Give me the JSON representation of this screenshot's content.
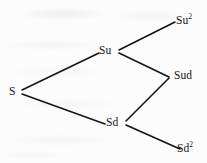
{
  "figure": {
    "type": "binomial-tree",
    "background_color": "#fcfcfc",
    "stroke_color": "#14141a",
    "text_color": "#14141a"
  },
  "nodes": [
    {
      "id": "s",
      "base": "S",
      "exponent": "",
      "step": 0,
      "x": 13,
      "y": 92,
      "anchor_x": 22,
      "anchor_y": 92
    },
    {
      "id": "su",
      "base": "Su",
      "exponent": "",
      "step": 1,
      "x": 105,
      "y": 51,
      "anchor_x": 117,
      "anchor_y": 52
    },
    {
      "id": "sd",
      "base": "Sd",
      "exponent": "",
      "step": 1,
      "x": 112,
      "y": 123,
      "anchor_x": 126,
      "anchor_y": 123
    },
    {
      "id": "su2",
      "base": "Su",
      "exponent": "2",
      "step": 2,
      "x": 182,
      "y": 21,
      "anchor_x": 175,
      "anchor_y": 22
    },
    {
      "id": "sud",
      "base": "Sud",
      "exponent": "",
      "step": 2,
      "x": 181,
      "y": 76,
      "anchor_x": 169,
      "anchor_y": 77
    },
    {
      "id": "sd2",
      "base": "Sd",
      "exponent": "2",
      "step": 2,
      "x": 183,
      "y": 149,
      "anchor_x": 180,
      "anchor_y": 148
    }
  ],
  "edges": [
    {
      "id": "s-su",
      "from": "s",
      "to": "su",
      "direction": "up",
      "x1": 22,
      "y1": 90,
      "x2": 99,
      "y2": 53
    },
    {
      "id": "s-sd",
      "from": "s",
      "to": "sd",
      "direction": "down",
      "x1": 22,
      "y1": 94,
      "x2": 105,
      "y2": 124
    },
    {
      "id": "su-su2",
      "from": "su",
      "to": "su2",
      "direction": "up",
      "x1": 119,
      "y1": 50,
      "x2": 175,
      "y2": 22
    },
    {
      "id": "su-sud",
      "from": "su",
      "to": "sud",
      "direction": "down",
      "x1": 119,
      "y1": 53,
      "x2": 169,
      "y2": 77
    },
    {
      "id": "sd-sud",
      "from": "sd",
      "to": "sud",
      "direction": "up",
      "x1": 126,
      "y1": 121,
      "x2": 169,
      "y2": 78
    },
    {
      "id": "sd-sd2",
      "from": "sd",
      "to": "sd2",
      "direction": "down",
      "x1": 126,
      "y1": 125,
      "x2": 180,
      "y2": 149
    }
  ],
  "labels": {
    "s": "S",
    "su": "Su",
    "sd": "Sd",
    "su2_base": "Su",
    "su2_exp": "2",
    "sud": "Sud",
    "sd2_base": "Sd",
    "sd2_exp": "2"
  }
}
